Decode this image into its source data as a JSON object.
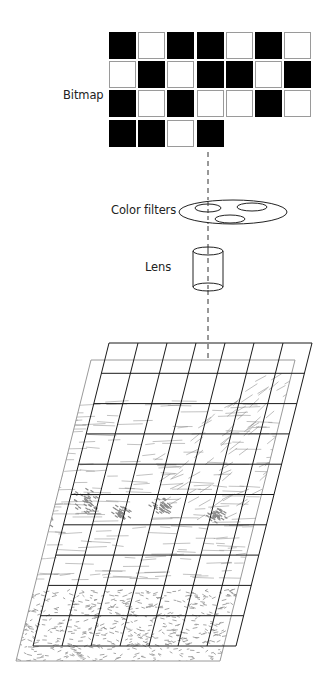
{
  "labels": {
    "bitmap": "Bitmap",
    "color_filters": "Color filters",
    "lens": "Lens"
  },
  "bitmap": {
    "rows": [
      [
        1,
        0,
        1,
        1,
        0,
        1,
        0
      ],
      [
        0,
        1,
        0,
        1,
        1,
        0,
        1
      ],
      [
        1,
        0,
        1,
        0,
        0,
        1,
        0
      ],
      [
        1,
        1,
        0,
        1
      ]
    ],
    "origin_x": 109,
    "origin_y": 32,
    "pitch": 29.2,
    "on_color": "#000000",
    "off_border_color": "#9a9a9a"
  },
  "projection": {
    "axis_x": 208,
    "dash_color": "#333333",
    "segments": [
      [
        152,
        200
      ],
      [
        226,
        250
      ],
      [
        290,
        358
      ]
    ]
  },
  "color_filters": {
    "disc": {
      "cx": 233,
      "cy": 212,
      "rx": 54,
      "ry": 12
    },
    "holes": [
      {
        "cx": 208,
        "cy": 208,
        "rx": 13,
        "ry": 4
      },
      {
        "cx": 252,
        "cy": 207,
        "rx": 15,
        "ry": 4
      },
      {
        "cx": 230,
        "cy": 219,
        "rx": 15,
        "ry": 4
      }
    ]
  },
  "lens": {
    "x": 193,
    "top": 251,
    "bottom": 287,
    "width": 30,
    "cap_ry": 4
  },
  "picture": {
    "corners": [
      [
        91,
        360
      ],
      [
        295,
        360
      ],
      [
        220,
        661
      ],
      [
        16,
        661
      ]
    ],
    "sketch_color": "#8a8a8a"
  },
  "overlay_grid": {
    "top_left": [
      109,
      343
    ],
    "top_right": [
      312,
      343
    ],
    "bottom_left": [
      33,
      646
    ],
    "bottom_right": [
      236,
      646
    ],
    "columns": 7,
    "rows": 10,
    "line_color": "#1a1a1a"
  }
}
